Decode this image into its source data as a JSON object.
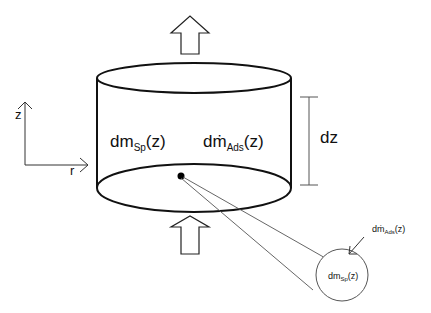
{
  "diagram": {
    "axes": {
      "vertical_label": "z",
      "horizontal_label": "r"
    },
    "height_marker": {
      "label": "dz"
    },
    "main_labels": {
      "spray_mass": {
        "base": "dm",
        "sub": "Sp",
        "arg": "(z)"
      },
      "adsorption_rate": {
        "base": "dṁ",
        "sub": "Ads",
        "arg": "(z)"
      }
    },
    "detail_circle": {
      "inner": {
        "base": "dm",
        "sub": "Sp",
        "arg": "(z)"
      },
      "incoming": {
        "base": "dṁ",
        "sub": "Ads",
        "arg": "(z)"
      }
    },
    "flow_arrows": [
      "upward-flow-top",
      "upward-flow-bottom"
    ],
    "colors": {
      "stroke": "#111111",
      "thin_stroke": "#444444",
      "background": "#ffffff"
    }
  }
}
